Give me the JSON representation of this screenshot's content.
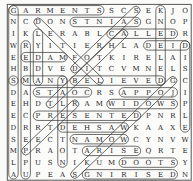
{
  "puzzle": {
    "kind": "word-search",
    "rows": 15,
    "cols": 15,
    "grid": [
      "GARMENTSSCSEKJO",
      "NCDONSTNIASGNOP",
      "IKLERABLCALLEDR",
      "WRYITIERHLADEID",
      "EEDAMFOTKIRELAI",
      "HBDVEDITCVMNELS",
      "SMANYBELIEVEDGC",
      "DASTAOCRSAPPOJI",
      "EHDTLRAMWIDOWSP",
      "ECPRESENTEDPNRL",
      "DRRTDEHSAWKAAXE",
      "SEECTNAMOWCYNVW",
      "MPRAOTARISEQRTE",
      "LPUSNIKUMDOOTSY",
      "AUPEASGNIRISEDN"
    ],
    "found_words": [
      {
        "word": "GARMENTS",
        "direction": "right",
        "start": {
          "row": 0,
          "col": 0
        },
        "end": {
          "row": 0,
          "col": 7
        }
      },
      {
        "word": "SAINTS",
        "direction": "left",
        "start": {
          "row": 1,
          "col": 10
        },
        "end": {
          "row": 1,
          "col": 5
        }
      },
      {
        "word": "CALLED",
        "direction": "right",
        "start": {
          "row": 2,
          "col": 8
        },
        "end": {
          "row": 2,
          "col": 13
        }
      },
      {
        "word": "DIED",
        "direction": "left",
        "start": {
          "row": 3,
          "col": 14
        },
        "end": {
          "row": 3,
          "col": 11
        }
      },
      {
        "word": "MADE",
        "direction": "left",
        "start": {
          "row": 4,
          "col": 4
        },
        "end": {
          "row": 4,
          "col": 1
        }
      },
      {
        "word": "MANY",
        "direction": "right",
        "start": {
          "row": 6,
          "col": 1
        },
        "end": {
          "row": 6,
          "col": 4
        }
      },
      {
        "word": "BELIEVED",
        "direction": "right",
        "start": {
          "row": 6,
          "col": 5
        },
        "end": {
          "row": 6,
          "col": 12
        }
      },
      {
        "word": "COATS",
        "direction": "left",
        "start": {
          "row": 7,
          "col": 6
        },
        "end": {
          "row": 7,
          "col": 2
        }
      },
      {
        "word": "JOPPA",
        "direction": "left",
        "start": {
          "row": 7,
          "col": 13
        },
        "end": {
          "row": 7,
          "col": 9
        }
      },
      {
        "word": "WIDOWS",
        "direction": "right",
        "start": {
          "row": 8,
          "col": 8
        },
        "end": {
          "row": 8,
          "col": 13
        }
      },
      {
        "word": "PRESENTED",
        "direction": "right",
        "start": {
          "row": 9,
          "col": 2
        },
        "end": {
          "row": 9,
          "col": 10
        }
      },
      {
        "word": "WASHED",
        "direction": "left",
        "start": {
          "row": 10,
          "col": 9
        },
        "end": {
          "row": 10,
          "col": 4
        }
      },
      {
        "word": "WOMAN",
        "direction": "left",
        "start": {
          "row": 11,
          "col": 9
        },
        "end": {
          "row": 11,
          "col": 5
        }
      },
      {
        "word": "ARISE",
        "direction": "right",
        "start": {
          "row": 12,
          "col": 6
        },
        "end": {
          "row": 12,
          "col": 10
        }
      },
      {
        "word": "STOOD",
        "direction": "left",
        "start": {
          "row": 13,
          "col": 13
        },
        "end": {
          "row": 13,
          "col": 9
        }
      },
      {
        "word": "DESIRING",
        "direction": "left",
        "start": {
          "row": 14,
          "col": 13
        },
        "end": {
          "row": 14,
          "col": 6
        }
      },
      {
        "word": "SHEWING",
        "direction": "up",
        "start": {
          "row": 6,
          "col": 0
        },
        "end": {
          "row": 0,
          "col": 0
        }
      },
      {
        "word": "ALMSDEEDS",
        "direction": "up",
        "start": {
          "row": 14,
          "col": 0
        },
        "end": {
          "row": 6,
          "col": 0
        }
      },
      {
        "word": "UPPERCHAMBER",
        "direction": "up",
        "start": {
          "row": 14,
          "col": 1
        },
        "end": {
          "row": 3,
          "col": 1
        }
      },
      {
        "word": "NOTDELAY",
        "direction": "up",
        "start": {
          "row": 13,
          "col": 4
        },
        "end": {
          "row": 6,
          "col": 4
        }
      },
      {
        "word": "LYDDA",
        "direction": "down",
        "start": {
          "row": 2,
          "col": 2
        },
        "end": {
          "row": 6,
          "col": 2
        }
      },
      {
        "word": "KNEELED",
        "direction": "down",
        "start": {
          "row": 0,
          "col": 12
        },
        "end": {
          "row": 6,
          "col": 12
        }
      },
      {
        "word": "DISCIPLE",
        "direction": "down",
        "start": {
          "row": 3,
          "col": 14
        },
        "end": {
          "row": 10,
          "col": 14
        }
      },
      {
        "word": "DORCAS",
        "direction": "up-right",
        "start": {
          "row": 5,
          "col": 5
        },
        "end": {
          "row": 0,
          "col": 10
        }
      },
      {
        "word": "TABITHA",
        "direction": "up-right",
        "start": {
          "row": 8,
          "col": 3
        },
        "end": {
          "row": 2,
          "col": 9
        }
      },
      {
        "word": "PETER",
        "direction": "up-right",
        "start": {
          "row": 12,
          "col": 1
        },
        "end": {
          "row": 8,
          "col": 5
        }
      },
      {
        "word": "LIFTED",
        "direction": "up-left",
        "start": {
          "row": 6,
          "col": 7
        },
        "end": {
          "row": 1,
          "col": 2
        }
      },
      {
        "word": "GOODWORKS",
        "direction": "down-left",
        "start": {
          "row": 6,
          "col": 13
        },
        "end": {
          "row": 14,
          "col": 5
        }
      }
    ],
    "colors": {
      "paper": "#fbfbfa",
      "ink": "#262626",
      "loop": "#3f3f3f",
      "border": "#565656"
    }
  }
}
